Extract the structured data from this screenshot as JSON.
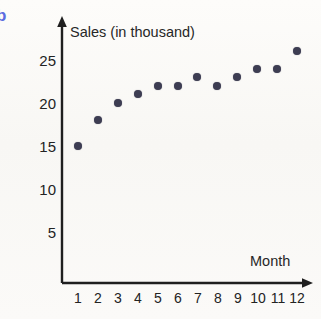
{
  "figure_label": "b",
  "figure_label_color": "#5b6ce0",
  "background_color": "#fbfaf8",
  "axis_color": "#1f1f1f",
  "marker_color": "#3d3d52",
  "chart_data": {
    "type": "scatter",
    "title": "Sales (in thousand)",
    "xlabel": "Month",
    "ylabel": "Sales (in thousand)",
    "x": [
      1,
      2,
      3,
      4,
      5,
      6,
      7,
      8,
      9,
      10,
      11,
      12
    ],
    "values": [
      15,
      18,
      20,
      21,
      22,
      22,
      23,
      22,
      23,
      24,
      24,
      26
    ],
    "categories": [
      "1",
      "2",
      "3",
      "4",
      "5",
      "6",
      "7",
      "8",
      "9",
      "10",
      "11",
      "12"
    ],
    "xtick_labels": [
      "1",
      "2",
      "3",
      "4",
      "5",
      "6",
      "7",
      "8",
      "9",
      "10",
      "11",
      "12"
    ],
    "ytick_labels": [
      "5",
      "10",
      "15",
      "20",
      "25"
    ],
    "ytick_values": [
      5,
      10,
      15,
      20,
      25
    ],
    "xlim": [
      0,
      12.6
    ],
    "ylim": [
      0,
      27.5
    ],
    "grid": false,
    "legend": false,
    "axis_arrows": true,
    "points": [
      {
        "month": 1,
        "sales": 15
      },
      {
        "month": 2,
        "sales": 18
      },
      {
        "month": 3,
        "sales": 20
      },
      {
        "month": 4,
        "sales": 21
      },
      {
        "month": 5,
        "sales": 22
      },
      {
        "month": 6,
        "sales": 22
      },
      {
        "month": 7,
        "sales": 23
      },
      {
        "month": 8,
        "sales": 22
      },
      {
        "month": 9,
        "sales": 23
      },
      {
        "month": 10,
        "sales": 24
      },
      {
        "month": 11,
        "sales": 24
      },
      {
        "month": 12,
        "sales": 26
      }
    ]
  }
}
